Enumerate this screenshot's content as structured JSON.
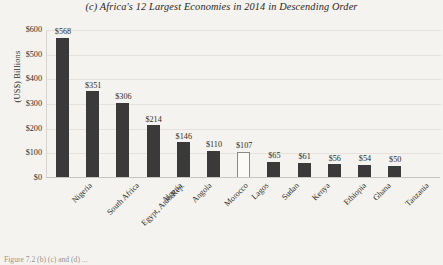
{
  "chart_data": {
    "type": "bar",
    "title": "(c) Africa's 12 Largest Economies in 2014 in Descending Order",
    "xlabel": "",
    "ylabel": "(US$) Billions",
    "ylim": [
      0,
      600
    ],
    "yticks": [
      "$0",
      "$100",
      "$200",
      "$300",
      "$400",
      "$500",
      "$600"
    ],
    "ytick_values": [
      0,
      100,
      200,
      300,
      400,
      500,
      600
    ],
    "grid": true,
    "legend": "none",
    "categories": [
      "Nigeria",
      "South Africa",
      "Egypt, Arab Rep.",
      "Algeria",
      "Angola",
      "Morocco",
      "Lagos",
      "Sudan",
      "Kenya",
      "Ethiopia",
      "Ghana",
      "Tanzania"
    ],
    "values": [
      568,
      351,
      306,
      214,
      146,
      110,
      107,
      65,
      61,
      56,
      54,
      50
    ],
    "data_labels": [
      "$568",
      "$351",
      "$306",
      "$214",
      "$146",
      "$110",
      "$107",
      "$65",
      "$61",
      "$56",
      "$54",
      "$50"
    ],
    "highlight_index": 6,
    "highlight_note": "Lagos bar drawn hollow/white to distinguish city from countries",
    "colors": {
      "bar": "#3a3a3a",
      "bar_highlight_fill": "#fbfaf7",
      "bar_highlight_outline": "#8b8781",
      "background": "#f5f3ef",
      "gridline": "#e6e2db",
      "axis": "#c9c4bc",
      "text": "#2f2c28"
    }
  },
  "caption": {
    "cutoff_text": "Figure 7.2 (b) (c) and (d) ..."
  }
}
